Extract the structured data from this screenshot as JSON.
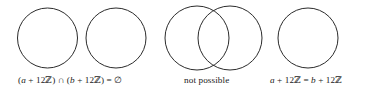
{
  "figure": {
    "background_color": "#ffffff",
    "stroke_color": "#2b2b2b",
    "text_color": "#1a1a1a",
    "panels": [
      {
        "id": "disjoint",
        "caption": "(a + 12ℤ) ∩ (b + 12ℤ) = ∅",
        "relation": "disjoint",
        "circles": [
          {
            "cx": 47.5,
            "cy": 38,
            "r": 30
          },
          {
            "cx": 116,
            "cy": 38,
            "r": 30
          }
        ]
      },
      {
        "id": "not-possible",
        "caption": "not possible",
        "relation": "partial-overlap",
        "circles": [
          {
            "cx": 197,
            "cy": 38,
            "r": 32
          },
          {
            "cx": 230,
            "cy": 38,
            "r": 32
          }
        ]
      },
      {
        "id": "equal",
        "caption": "a + 12ℤ = b + 12ℤ",
        "relation": "equal",
        "circles": [
          {
            "cx": 308,
            "cy": 38,
            "r": 30
          }
        ]
      }
    ]
  },
  "captions": {
    "disjoint": {
      "open_paren": "(",
      "a": "a",
      "plus1": " + ",
      "twelve1": "12ℤ",
      "close_paren1": ") ",
      "cap": "∩",
      "open_paren2": " (",
      "b": "b",
      "plus2": " + ",
      "twelve2": "12ℤ",
      "close_paren2": ") = ",
      "emptyset": "∅",
      "full": "(a + 12ℤ) ∩ (b + 12ℤ) = ∅"
    },
    "not_possible": {
      "full": "not possible"
    },
    "equal": {
      "a": "a",
      "plus1": " + ",
      "twelve1": "12ℤ",
      "eq": " = ",
      "b": "b",
      "plus2": " + ",
      "twelve2": "12ℤ",
      "full": "a + 12ℤ = b + 12ℤ"
    }
  }
}
